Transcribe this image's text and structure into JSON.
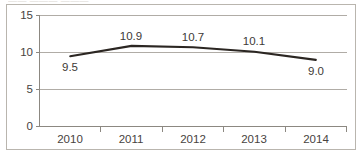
{
  "title_remnant": "—— ——— ———",
  "chart_data": {
    "type": "line",
    "title": "",
    "xlabel": "",
    "ylabel": "",
    "categories": [
      "2010",
      "2011",
      "2012",
      "2013",
      "2014"
    ],
    "values": [
      9.5,
      10.9,
      10.7,
      10.1,
      9.0
    ],
    "data_labels": [
      "9.5",
      "10.9",
      "10.7",
      "10.1",
      "9.0"
    ],
    "data_label_positions": [
      "below",
      "above",
      "above",
      "above",
      "below"
    ],
    "series": [
      {
        "name": "",
        "values": [
          9.5,
          10.9,
          10.7,
          10.1,
          9.0
        ]
      }
    ],
    "ylim": [
      0,
      15
    ],
    "ytick_labels": [
      "0",
      "5",
      "10",
      "15"
    ],
    "ytick_values": [
      0,
      5,
      10,
      15
    ],
    "grid": true,
    "grid_axis": "y",
    "legend": false,
    "legend_position": "none",
    "markers": false,
    "line_color": "#2b2622",
    "grid_color": "#b0aca6",
    "axis_color": "#8c8881",
    "border_color": "#b9b5ae",
    "background_color": "#ffffff",
    "text_color": "#474340"
  }
}
